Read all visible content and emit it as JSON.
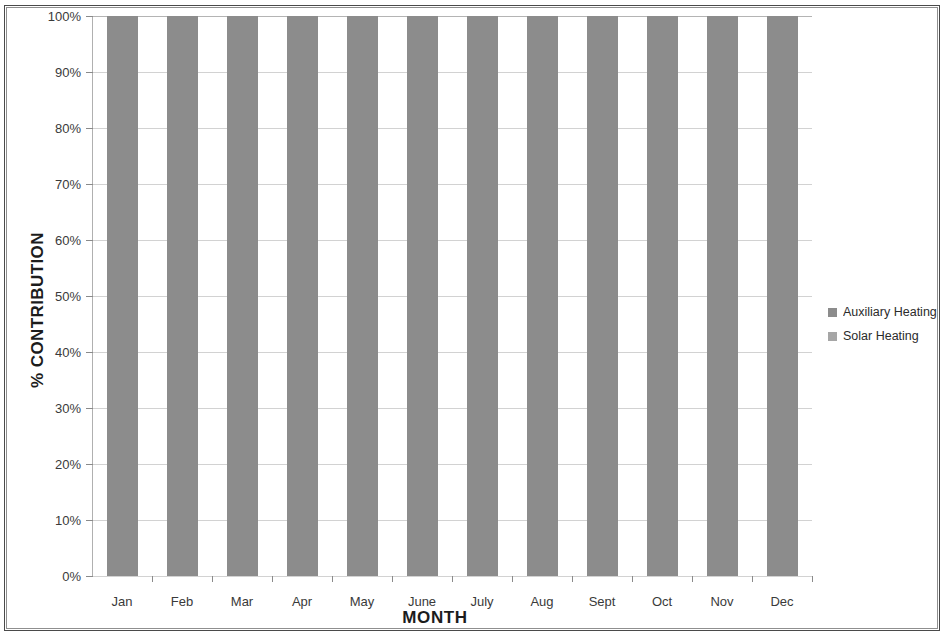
{
  "chart_data": {
    "type": "bar",
    "subtype": "stacked-100-percent",
    "title": "",
    "xlabel": "MONTH",
    "ylabel": "% CONTRIBUTION",
    "categories": [
      "Jan",
      "Feb",
      "Mar",
      "Apr",
      "May",
      "June",
      "July",
      "Aug",
      "Sept",
      "Oct",
      "Nov",
      "Dec"
    ],
    "series": [
      {
        "name": "Auxiliary Heating",
        "color": "#8c8c8c",
        "values": [
          100,
          100,
          100,
          100,
          100,
          100,
          100,
          100,
          100,
          100,
          100,
          100
        ]
      },
      {
        "name": "Solar Heating",
        "color": "#a6a6a6",
        "values": [
          0,
          0,
          0,
          0,
          0,
          0,
          0,
          0,
          0,
          0,
          0,
          0
        ]
      }
    ],
    "ylim": [
      0,
      100
    ],
    "ytick_values": [
      0,
      10,
      20,
      30,
      40,
      50,
      60,
      70,
      80,
      90,
      100
    ],
    "ytick_labels": [
      "0%",
      "10%",
      "20%",
      "30%",
      "40%",
      "50%",
      "60%",
      "70%",
      "80%",
      "90%",
      "100%"
    ],
    "grid": true,
    "grid_axis": "y",
    "legend_position": "right",
    "legend_entries": [
      "Auxiliary Heating",
      "Solar Heating"
    ]
  },
  "colors": {
    "auxiliary_heating": "#8c8c8c",
    "solar_heating": "#a6a6a6",
    "gridline": "#d2d2d2",
    "axis": "#7d7d7d",
    "text": "#3a3a3a",
    "page_border": "#4a4a4a"
  }
}
